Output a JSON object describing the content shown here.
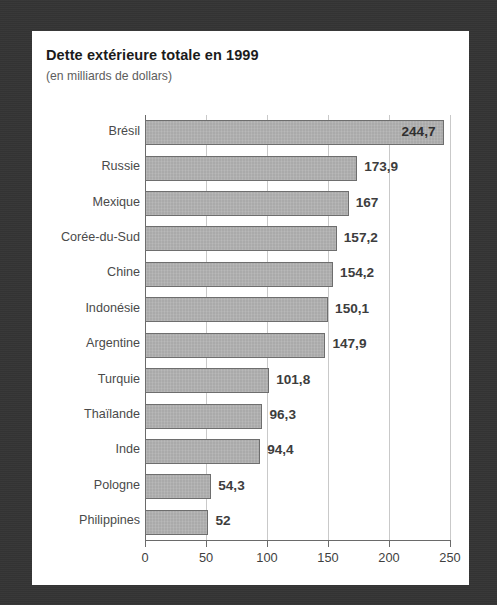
{
  "chart_data": {
    "type": "bar",
    "orientation": "horizontal",
    "title": "Dette extérieure totale en 1999",
    "subtitle": "(en milliards de dollars)",
    "xlabel": "",
    "ylabel": "",
    "xlim": [
      0,
      250
    ],
    "xticks": [
      "0",
      "50",
      "100",
      "150",
      "200",
      "250"
    ],
    "xtick_values": [
      0,
      50,
      100,
      150,
      200,
      250
    ],
    "grid": true,
    "legend": false,
    "categories": [
      "Brésil",
      "Russie",
      "Mexique",
      "Corée-du-Sud",
      "Chine",
      "Indonésie",
      "Argentine",
      "Turquie",
      "Thaïlande",
      "Inde",
      "Pologne",
      "Philippines"
    ],
    "values": [
      244.7,
      173.9,
      167,
      157.2,
      154.2,
      150.1,
      147.9,
      101.8,
      96.3,
      94.4,
      54.3,
      52
    ],
    "value_labels": [
      "244,7",
      "173,9",
      "167",
      "157,2",
      "154,2",
      "150,1",
      "147,9",
      "101,8",
      "96,3",
      "94,4",
      "54,3",
      "52"
    ],
    "colors": {
      "bar_fill": "#aaaaaa",
      "bar_stroke": "#6e6e6e",
      "grid": "#c9c9c9",
      "axis": "#6a6a6a",
      "title": "#1b1b1b",
      "subtitle": "#5d5d5d",
      "category_label": "#4a4a4a",
      "value_label": "#3d3d3d",
      "card_background": "#ffffff",
      "frame_background": "#343434"
    }
  }
}
